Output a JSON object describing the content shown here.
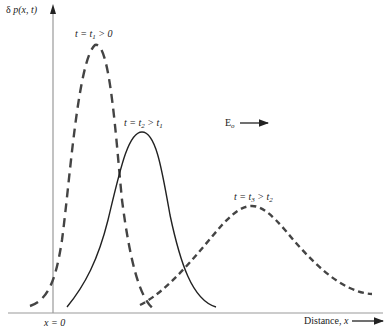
{
  "axes": {
    "y_label_prefix": "δ ",
    "y_label_func": "p(x, t)",
    "x_label_text": "Distance, ",
    "x_label_var": "x",
    "origin_label": "x = 0"
  },
  "field": {
    "label": "E",
    "subscript": "o"
  },
  "curves": [
    {
      "name": "t1",
      "style": "dashed",
      "label_parts": [
        "t = t",
        "1",
        " > 0"
      ]
    },
    {
      "name": "t2",
      "style": "solid",
      "label_parts": [
        "t = t",
        "2",
        " > t",
        "1"
      ]
    },
    {
      "name": "t3",
      "style": "dashed",
      "label_parts": [
        "t = t",
        "3",
        " > t",
        "2"
      ]
    }
  ],
  "colors": {
    "axis": "#999999",
    "curve": "#222222",
    "dashed": "#444444"
  }
}
